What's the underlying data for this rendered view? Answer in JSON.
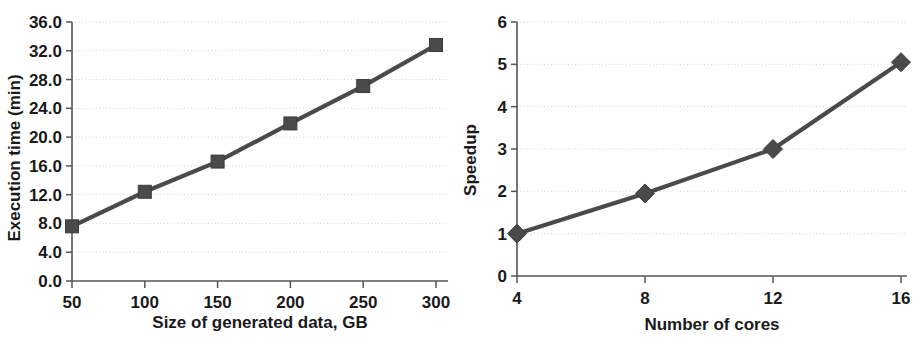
{
  "chart_data": [
    {
      "id": "execution-time-chart",
      "type": "line",
      "title": "",
      "xlabel": "Size of generated data, GB",
      "ylabel": "Execution time (min)",
      "marker": "square",
      "grid": true,
      "legend": "none",
      "x": [
        50,
        100,
        150,
        200,
        250,
        300
      ],
      "values": [
        7.6,
        12.4,
        16.6,
        21.9,
        27.1,
        32.8
      ],
      "xtick_labels": [
        "50",
        "100",
        "150",
        "200",
        "250",
        "300"
      ],
      "ytick_labels": [
        "0.0",
        "4.0",
        "8.0",
        "12.0",
        "16.0",
        "20.0",
        "24.0",
        "28.0",
        "32.0",
        "36.0"
      ],
      "ytick_values": [
        0,
        4,
        8,
        12,
        16,
        20,
        24,
        28,
        32,
        36
      ],
      "xlim": [
        50,
        300
      ],
      "ylim": [
        0,
        36
      ],
      "series_color": "#4a4a4a"
    },
    {
      "id": "speedup-chart",
      "type": "line",
      "title": "",
      "xlabel": "Number of cores",
      "ylabel": "Speedup",
      "marker": "diamond",
      "grid": true,
      "legend": "none",
      "x": [
        4,
        8,
        12,
        16
      ],
      "values": [
        1.0,
        1.95,
        3.0,
        5.05
      ],
      "xtick_labels": [
        "4",
        "8",
        "12",
        "16"
      ],
      "ytick_labels": [
        "0",
        "1",
        "2",
        "3",
        "4",
        "5",
        "6"
      ],
      "ytick_values": [
        0,
        1,
        2,
        3,
        4,
        5,
        6
      ],
      "xlim": [
        4,
        16
      ],
      "ylim": [
        0,
        6
      ],
      "series_color": "#4a4a4a"
    }
  ]
}
